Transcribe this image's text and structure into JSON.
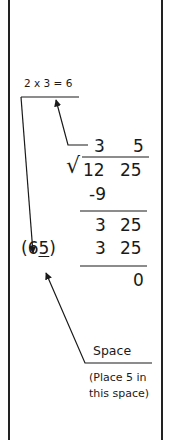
{
  "diagram": {
    "title_hint": "2 x 3 = 6",
    "quotient": [
      "3",
      "5"
    ],
    "dividend": [
      "12",
      "25"
    ],
    "step1_subtract": "-9",
    "remainder": [
      "3",
      "25"
    ],
    "product": [
      "3",
      "25"
    ],
    "final": "0",
    "divisor_open": "(",
    "divisor_digit1": "6",
    "divisor_digit2": "5",
    "divisor_close": ")",
    "space_label": "Space",
    "space_note_line1": "(Place 5 in",
    "space_note_line2": "this space)",
    "colors": {
      "ink": "#1a1a1a",
      "frame": "#222222",
      "background": "#ffffff"
    }
  }
}
